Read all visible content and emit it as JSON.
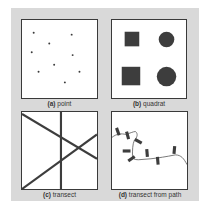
{
  "figure": {
    "panels": [
      {
        "id": "a",
        "letter": "(a)",
        "label": "point"
      },
      {
        "id": "b",
        "letter": "(b)",
        "label": "quadrat"
      },
      {
        "id": "c",
        "letter": "(c)",
        "label": "transect"
      },
      {
        "id": "d",
        "letter": "(d)",
        "label": "transect from path"
      }
    ]
  },
  "colors": {
    "background": "#d9d9d9",
    "panel_fill": "#ffffff",
    "ink": "#3a3a3a"
  }
}
